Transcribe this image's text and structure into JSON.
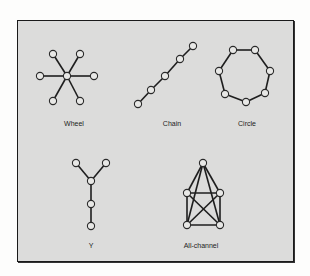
{
  "networks": [
    {
      "label": "Wheel",
      "label_pos": [
        74,
        120
      ],
      "nodes": [
        [
          67,
          76
        ],
        [
          53,
          54
        ],
        [
          80,
          54
        ],
        [
          40,
          76
        ],
        [
          94,
          76
        ],
        [
          53,
          101
        ],
        [
          80,
          101
        ]
      ],
      "edges": [
        [
          0,
          1
        ],
        [
          0,
          2
        ],
        [
          0,
          3
        ],
        [
          0,
          4
        ],
        [
          0,
          5
        ],
        [
          0,
          6
        ]
      ]
    },
    {
      "label": "Chain",
      "label_pos": [
        172,
        120
      ],
      "nodes": [
        [
          138,
          104
        ],
        [
          151,
          90
        ],
        [
          165,
          76
        ],
        [
          180,
          59
        ],
        [
          193,
          46
        ]
      ],
      "edges": [
        [
          0,
          1
        ],
        [
          1,
          2
        ],
        [
          2,
          3
        ],
        [
          3,
          4
        ]
      ]
    },
    {
      "label": "Circle",
      "label_pos": [
        247,
        120
      ],
      "nodes": [
        [
          233,
          50
        ],
        [
          255,
          50
        ],
        [
          270,
          71
        ],
        [
          265,
          93
        ],
        [
          246,
          102
        ],
        [
          225,
          94
        ],
        [
          219,
          71
        ]
      ],
      "edges": [
        [
          0,
          1
        ],
        [
          1,
          2
        ],
        [
          2,
          3
        ],
        [
          3,
          4
        ],
        [
          4,
          5
        ],
        [
          5,
          6
        ],
        [
          6,
          0
        ]
      ]
    },
    {
      "label": "Y",
      "label_pos": [
        91,
        242
      ],
      "nodes": [
        [
          76,
          163
        ],
        [
          106,
          163
        ],
        [
          91,
          181
        ],
        [
          91,
          204
        ],
        [
          91,
          226
        ]
      ],
      "edges": [
        [
          0,
          2
        ],
        [
          1,
          2
        ],
        [
          2,
          3
        ],
        [
          3,
          4
        ]
      ]
    },
    {
      "label": "All-channel",
      "label_pos": [
        201,
        242
      ],
      "nodes": [
        [
          203,
          163
        ],
        [
          187,
          193
        ],
        [
          220,
          193
        ],
        [
          187,
          225
        ],
        [
          220,
          225
        ]
      ],
      "edges": [
        [
          0,
          1
        ],
        [
          0,
          2
        ],
        [
          0,
          3
        ],
        [
          0,
          4
        ],
        [
          1,
          2
        ],
        [
          1,
          3
        ],
        [
          1,
          4
        ],
        [
          2,
          3
        ],
        [
          2,
          4
        ],
        [
          3,
          4
        ]
      ]
    }
  ]
}
